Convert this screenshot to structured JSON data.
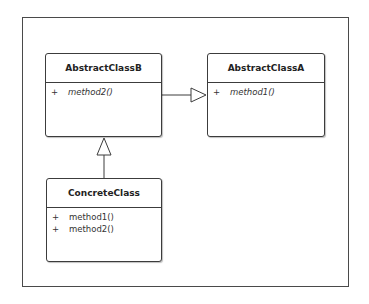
{
  "diagram": {
    "type": "UML class diagram",
    "classes": [
      {
        "id": "abstract-class-b",
        "name": "AbstractClassB",
        "abstract": true,
        "operations": [
          {
            "visibility": "+",
            "name": "method2()",
            "abstract": true
          }
        ]
      },
      {
        "id": "abstract-class-a",
        "name": "AbstractClassA",
        "abstract": true,
        "operations": [
          {
            "visibility": "+",
            "name": "method1()",
            "abstract": true
          }
        ]
      },
      {
        "id": "concrete-class",
        "name": "ConcreteClass",
        "abstract": false,
        "operations": [
          {
            "visibility": "+",
            "name": "method1()",
            "abstract": false
          },
          {
            "visibility": "+",
            "name": "method2()",
            "abstract": false
          }
        ]
      }
    ],
    "relationships": [
      {
        "type": "generalization",
        "from": "AbstractClassB",
        "to": "AbstractClassA"
      },
      {
        "type": "generalization",
        "from": "ConcreteClass",
        "to": "AbstractClassB"
      }
    ],
    "colors": {
      "border": "#3c3c3c",
      "frame": "#4a4a4a",
      "text": "#222222",
      "background": "#ffffff"
    }
  }
}
